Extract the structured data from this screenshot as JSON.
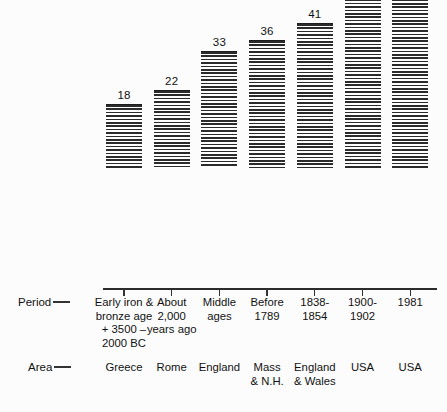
{
  "chart_data": {
    "type": "bar",
    "title": "",
    "subtitle": "",
    "xlabel": "",
    "ylabel": "",
    "ylim": [
      0,
      71
    ],
    "grid": false,
    "legend": null,
    "categories": [
      "Early iron & bronze age + 3500 - 2000 BC",
      "About 2,000 years ago",
      "Middle ages",
      "Before 1789",
      "1838-1854",
      "1900-1902",
      "1981"
    ],
    "values": [
      18,
      22,
      33,
      36,
      41,
      49,
      71
    ],
    "value_labels": [
      "18",
      "22",
      "33",
      "36",
      "41",
      "49",
      "71"
    ],
    "series": [
      {
        "name": "",
        "values": [
          18,
          22,
          33,
          36,
          41,
          49,
          71
        ]
      }
    ],
    "annotations": []
  },
  "axis_rows": [
    {
      "row_name": "period",
      "label": "Period",
      "cells": [
        {
          "lines": [
            "Early iron &",
            "bronze age",
            "+ 3500 –",
            "2000  BC"
          ]
        },
        {
          "lines": [
            "About",
            "2,000",
            "years ago"
          ]
        },
        {
          "lines": [
            "Middle",
            "ages"
          ]
        },
        {
          "lines": [
            "Before",
            "1789"
          ]
        },
        {
          "lines": [
            "1838-",
            "1854"
          ]
        },
        {
          "lines": [
            "1900-",
            "1902"
          ]
        },
        {
          "lines": [
            "1981"
          ]
        }
      ]
    },
    {
      "row_name": "area",
      "label": "Area",
      "cells": [
        {
          "lines": [
            "Greece"
          ]
        },
        {
          "lines": [
            "Rome"
          ]
        },
        {
          "lines": [
            "England"
          ]
        },
        {
          "lines": [
            "Mass",
            "& N.H."
          ]
        },
        {
          "lines": [
            "England",
            "& Wales"
          ]
        },
        {
          "lines": [
            "USA"
          ]
        },
        {
          "lines": [
            "USA"
          ]
        }
      ]
    }
  ],
  "style": {
    "background": "#fcfcfc",
    "ink": "#1d1d1d",
    "bar_fill": "#2b2b2b",
    "axis": "#2b2b2b"
  },
  "geometry": {
    "baseline_y": 288,
    "px_per_unit": 3.52,
    "bar_width": 36,
    "tick_x": [
      124,
      171.7,
      219.4,
      267.1,
      314.8,
      362.5,
      410.2
    ]
  }
}
